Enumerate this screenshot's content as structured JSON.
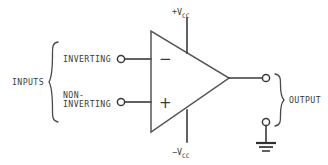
{
  "diagram": {
    "colors": {
      "wire": "#3a3a3a",
      "body": "#555555",
      "text": "#3b3b3b",
      "background": "#ffffff"
    },
    "inputs": {
      "group_label": "INPUTS",
      "terminals": [
        {
          "label": "INVERTING",
          "sign": "−",
          "sign_name": "minus"
        },
        {
          "label_line1": "NON-",
          "label_line2": "INVERTING",
          "sign": "+",
          "sign_name": "plus"
        }
      ]
    },
    "supplies": {
      "positive": {
        "prefix": "+V",
        "subscript": "CC"
      },
      "negative": {
        "prefix": "−V",
        "subscript": "CC"
      }
    },
    "output": {
      "group_label": "OUTPUT",
      "ground_label": ""
    }
  }
}
